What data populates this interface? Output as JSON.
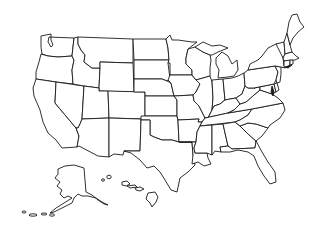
{
  "map": {
    "type": "blank-outline",
    "subject": "United States of America",
    "fill_color": "#ffffff",
    "stroke_color": "#1a1a1a",
    "labels_shown": false,
    "regions": [
      "Washington",
      "Oregon",
      "California",
      "Nevada",
      "Idaho",
      "Montana",
      "Wyoming",
      "Utah",
      "Arizona",
      "Colorado",
      "New Mexico",
      "North Dakota",
      "South Dakota",
      "Nebraska",
      "Kansas",
      "Oklahoma",
      "Texas",
      "Minnesota",
      "Iowa",
      "Missouri",
      "Arkansas",
      "Louisiana",
      "Wisconsin",
      "Illinois",
      "Michigan",
      "Indiana",
      "Ohio",
      "Kentucky",
      "Tennessee",
      "Mississippi",
      "Alabama",
      "Georgia",
      "Florida",
      "South Carolina",
      "North Carolina",
      "Virginia",
      "West Virginia",
      "Maryland",
      "Delaware",
      "Pennsylvania",
      "New Jersey",
      "New York",
      "Connecticut",
      "Rhode Island",
      "Massachusetts",
      "Vermont",
      "New Hampshire",
      "Maine",
      "Alaska",
      "Hawaii"
    ]
  }
}
